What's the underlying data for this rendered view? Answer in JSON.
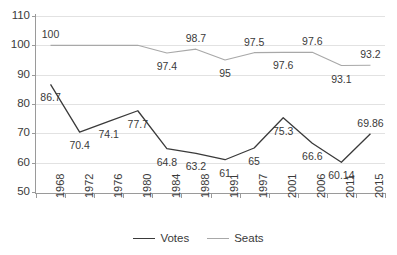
{
  "chart_data": {
    "type": "line",
    "title": "",
    "xlabel": "",
    "ylabel": "",
    "categories": [
      "1968",
      "1972",
      "1976",
      "1980",
      "1984",
      "1988",
      "1991",
      "1997",
      "2001",
      "2006",
      "2011",
      "2015"
    ],
    "series": [
      {
        "name": "Votes",
        "color": "#3a3a3a",
        "values": [
          86.7,
          70.4,
          74.1,
          77.7,
          64.8,
          63.2,
          61,
          65,
          75.3,
          66.6,
          60.14,
          69.86
        ],
        "labels": [
          "86.7",
          "70.4",
          "74.1",
          "77.7",
          "64.8",
          "63.2",
          "61",
          "65",
          "75.3",
          "66.6",
          "60.14",
          "69.86"
        ],
        "label_positions": [
          "below",
          "below",
          "below",
          "below",
          "below",
          "below",
          "below",
          "below",
          "below",
          "below",
          "below",
          "above"
        ]
      },
      {
        "name": "Seats",
        "color": "#a8a8a8",
        "values": [
          100,
          100,
          100,
          100,
          97.4,
          98.7,
          95,
          97.5,
          97.6,
          97.6,
          93.1,
          93.2
        ],
        "labels": [
          "100",
          "100",
          "100",
          "100",
          "97.4",
          "98.7",
          "95",
          "97.5",
          "97.6",
          "97.6",
          "93.1",
          "93.2"
        ],
        "label_positions": [
          "above",
          "above",
          "above",
          "above",
          "below",
          "above",
          "below",
          "above",
          "below",
          "above",
          "below",
          "above"
        ]
      }
    ],
    "ylim": [
      50,
      110
    ],
    "yticks": [
      50,
      60,
      70,
      80,
      90,
      100,
      110
    ],
    "ytick_labels": [
      "50",
      "60",
      "70",
      "80",
      "90",
      "100",
      "110"
    ],
    "grid": true,
    "legend_position": "bottom"
  }
}
